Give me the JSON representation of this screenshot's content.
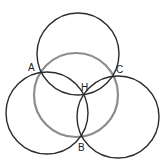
{
  "diagram": {
    "title": "",
    "circles": [
      {
        "id": "circumcircle",
        "cx": 76,
        "cy": 95,
        "r": 42,
        "stroke": "#8c8c8c",
        "width": 2.2
      },
      {
        "id": "top-circle",
        "cx": 78,
        "cy": 54,
        "r": 41,
        "stroke": "#2b2b2b",
        "width": 1.4
      },
      {
        "id": "left-circle",
        "cx": 47,
        "cy": 113,
        "r": 41,
        "stroke": "#2b2b2b",
        "width": 1.4
      },
      {
        "id": "right-circle",
        "cx": 118,
        "cy": 117,
        "r": 41,
        "stroke": "#2b2b2b",
        "width": 1.4
      }
    ],
    "points": [
      {
        "name": "A",
        "x": 41,
        "y": 71,
        "label_x": 28,
        "label_y": 71
      },
      {
        "name": "C",
        "x": 112,
        "y": 77,
        "label_x": 116,
        "label_y": 73
      },
      {
        "name": "H",
        "x": 86,
        "y": 94,
        "label_x": 81,
        "label_y": 91
      },
      {
        "name": "B",
        "x": 82,
        "y": 137,
        "label_x": 78,
        "label_y": 151
      }
    ]
  }
}
